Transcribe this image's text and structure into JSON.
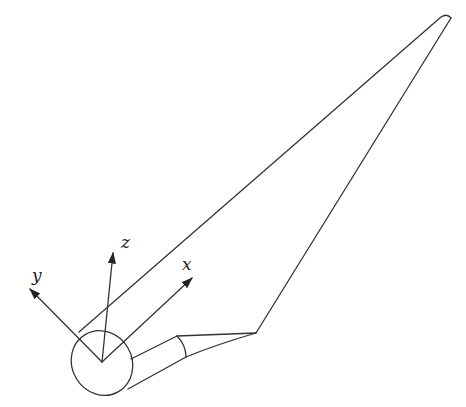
{
  "diagram": {
    "axes": [
      {
        "name": "x",
        "label": "x"
      },
      {
        "name": "y",
        "label": "y"
      },
      {
        "name": "z",
        "label": "z"
      }
    ],
    "colors": {
      "line": "#333333",
      "background": "#ffffff"
    }
  }
}
